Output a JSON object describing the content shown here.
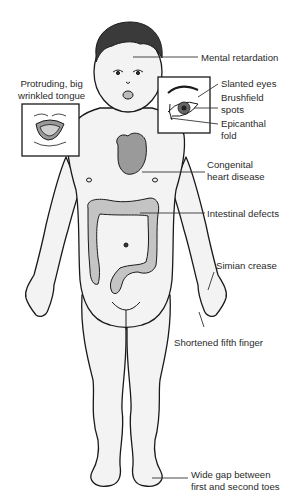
{
  "diagram": {
    "colors": {
      "skin_fill": "#f3f3f3",
      "outline": "#1a1a1a",
      "organ_fill": "#9a9a9a",
      "intestine_fill": "#c4c4c4",
      "hair": "#3a3a3a",
      "leader_line": "#333333"
    },
    "labels": [
      {
        "id": "mental-retardation",
        "lines": [
          "Mental retardation"
        ]
      },
      {
        "id": "protruding-tongue",
        "lines": [
          "Protruding, big",
          "wrinkled tongue"
        ]
      },
      {
        "id": "slanted-eyes",
        "lines": [
          "Slanted eyes"
        ]
      },
      {
        "id": "brushfield-spots",
        "lines": [
          "Brushfield",
          "spots"
        ]
      },
      {
        "id": "epicanthal-fold",
        "lines": [
          "Epicanthal",
          "fold"
        ]
      },
      {
        "id": "congenital-heart-disease",
        "lines": [
          "Congenital",
          "heart disease"
        ]
      },
      {
        "id": "intestinal-defects",
        "lines": [
          "Intestinal defects"
        ]
      },
      {
        "id": "simian-crease",
        "lines": [
          "Simian crease"
        ]
      },
      {
        "id": "shortened-fifth-finger",
        "lines": [
          "Shortened fifth finger"
        ]
      },
      {
        "id": "wide-gap-toes",
        "lines": [
          "Wide gap between",
          "first and second toes"
        ]
      }
    ],
    "insets": [
      {
        "id": "tongue-inset",
        "depicts": "mouth with protruding tongue"
      },
      {
        "id": "eye-inset",
        "depicts": "eye close-up"
      }
    ]
  }
}
